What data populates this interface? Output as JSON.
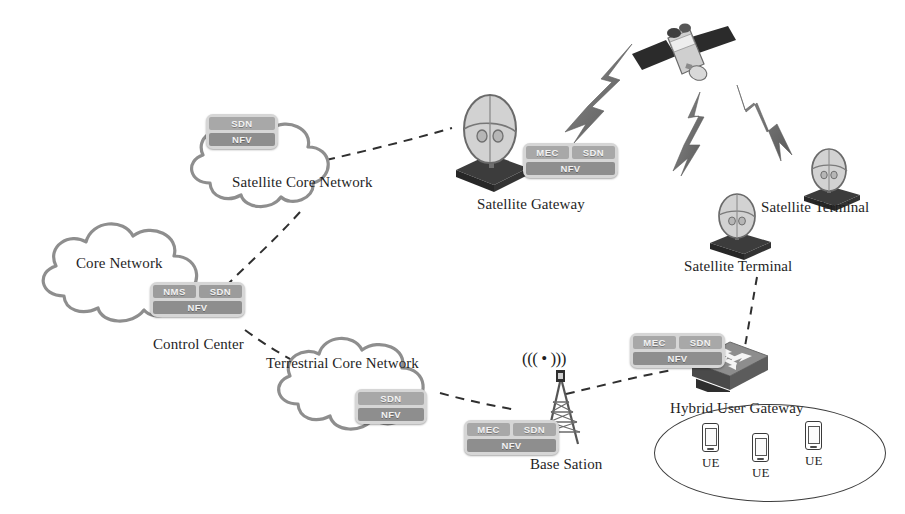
{
  "figure": {
    "background": "#ffffff",
    "line_color": "#3a3a3a",
    "chip_frame_color": "#d6d6d6",
    "chip_cell_color": "#a8a8a8"
  },
  "nodes": {
    "satellite": {
      "label": "",
      "icon": "satellite-icon"
    },
    "satellite_core_network": {
      "label": "Satellite Core Network",
      "icon": "cloud-icon",
      "chips": [
        [
          "SDN"
        ],
        [
          "NFV"
        ]
      ]
    },
    "core_network": {
      "label": "Core Network",
      "icon": "cloud-icon"
    },
    "control_center": {
      "label": "Control Center",
      "chips": [
        [
          "NMS",
          "SDN"
        ],
        [
          "NFV"
        ]
      ]
    },
    "terrestrial_core_network": {
      "label": "Terrestrial Core Network",
      "icon": "cloud-icon",
      "chips": [
        [
          "SDN"
        ],
        [
          "NFV"
        ]
      ]
    },
    "satellite_gateway": {
      "label": "Satellite Gateway",
      "icon": "satellite-dish-icon",
      "chips": [
        [
          "MEC",
          "SDN"
        ],
        [
          "NFV"
        ]
      ]
    },
    "satellite_terminal_right": {
      "label": "Satellite Terminal",
      "icon": "satellite-dish-icon"
    },
    "satellite_terminal_left": {
      "label": "Satellite Terminal",
      "icon": "satellite-dish-icon"
    },
    "hybrid_user_gateway": {
      "label": "Hybrid User Gateway",
      "icon": "router-icon",
      "chips": [
        [
          "MEC",
          "SDN"
        ],
        [
          "NFV"
        ]
      ]
    },
    "base_station": {
      "label": "Base Sation",
      "icon": "antenna-tower-icon",
      "signal_glyph": "((( • )))",
      "chips": [
        [
          "MEC",
          "SDN"
        ],
        [
          "NFV"
        ]
      ]
    },
    "ue_1": {
      "label": "UE",
      "icon": "smartphone-icon"
    },
    "ue_2": {
      "label": "UE",
      "icon": "smartphone-icon"
    },
    "ue_3": {
      "label": "UE",
      "icon": "smartphone-icon"
    }
  },
  "links": {
    "wireless": [
      {
        "from": "satellite",
        "to": "satellite_gateway",
        "style": "lightning-bolt"
      },
      {
        "from": "satellite",
        "to": "satellite_terminal_left",
        "style": "lightning-bolt"
      },
      {
        "from": "satellite",
        "to": "satellite_terminal_right",
        "style": "lightning-bolt"
      }
    ],
    "dashed": [
      {
        "from": "satellite_core_network",
        "to": "satellite_gateway"
      },
      {
        "from": "satellite_core_network",
        "to": "control_center"
      },
      {
        "from": "control_center",
        "to": "terrestrial_core_network"
      },
      {
        "from": "terrestrial_core_network",
        "to": "base_station"
      },
      {
        "from": "base_station",
        "to": "hybrid_user_gateway"
      },
      {
        "from": "satellite_terminal_left",
        "to": "hybrid_user_gateway"
      }
    ]
  }
}
